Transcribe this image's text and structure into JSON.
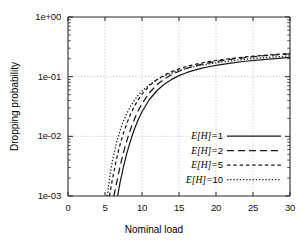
{
  "chart_data": {
    "type": "line",
    "title": "",
    "xlabel": "Nominal load",
    "ylabel": "Dropping probability",
    "xlim": [
      0,
      30
    ],
    "ylim": [
      0.001,
      1
    ],
    "yscale": "log",
    "xscale": "linear",
    "grid": true,
    "grid_style": "dotted",
    "legend_position": "lower right",
    "xticks": [
      "0",
      "5",
      "10",
      "15",
      "20",
      "25",
      "30"
    ],
    "xtick_values": [
      0,
      5,
      10,
      15,
      20,
      25,
      30
    ],
    "yticks": [
      "1e+00",
      "1e-01",
      "1e-02",
      "1e-03"
    ],
    "ytick_values": [
      1,
      0.1,
      0.01,
      0.001
    ],
    "y_minor_ticks": true,
    "series": [
      {
        "name": "E[H]=1",
        "style": "solid",
        "x": [
          6.7,
          7.0,
          7.5,
          8.0,
          8.5,
          9.0,
          9.5,
          10.0,
          11.0,
          12.0,
          13.0,
          14.0,
          15.0,
          16.0,
          17.0,
          18.0,
          19.0,
          20.0,
          22.0,
          24.0,
          26.0,
          28.0,
          30.0
        ],
        "y": [
          0.001,
          0.0016,
          0.0031,
          0.0055,
          0.0089,
          0.0135,
          0.0192,
          0.0258,
          0.0414,
          0.0581,
          0.0746,
          0.09,
          0.104,
          0.1165,
          0.1277,
          0.1377,
          0.1467,
          0.1549,
          0.1692,
          0.1813,
          0.1919,
          0.2013,
          0.2098
        ]
      },
      {
        "name": "E[H]=2",
        "style": "dashed",
        "x": [
          6.2,
          6.5,
          7.0,
          7.5,
          8.0,
          8.5,
          9.0,
          9.5,
          10.0,
          11.0,
          12.0,
          13.0,
          14.0,
          15.0,
          16.0,
          17.0,
          18.0,
          19.0,
          20.0,
          22.0,
          24.0,
          26.0,
          28.0,
          30.0
        ],
        "y": [
          0.001,
          0.0015,
          0.003,
          0.0054,
          0.0089,
          0.0137,
          0.0198,
          0.0271,
          0.0353,
          0.0537,
          0.0728,
          0.0911,
          0.108,
          0.1233,
          0.137,
          0.1493,
          0.1604,
          0.1704,
          0.1795,
          0.1956,
          0.2094,
          0.2215,
          0.2323,
          0.242
        ]
      },
      {
        "name": "E[H]=5",
        "style": "dotted-medium",
        "x": [
          5.6,
          6.0,
          6.5,
          7.0,
          7.5,
          8.0,
          8.5,
          9.0,
          9.5,
          10.0,
          11.0,
          12.0,
          13.0,
          14.0,
          15.0,
          16.0,
          17.0,
          18.0,
          19.0,
          20.0,
          22.0,
          24.0,
          26.0,
          28.0,
          30.0
        ],
        "y": [
          0.001,
          0.0019,
          0.0039,
          0.007,
          0.0114,
          0.0171,
          0.0242,
          0.0324,
          0.0414,
          0.0509,
          0.0703,
          0.0889,
          0.106,
          0.1214,
          0.1352,
          0.1476,
          0.1588,
          0.1689,
          0.1781,
          0.1866,
          0.2016,
          0.2146,
          0.226,
          0.2362,
          0.2455
        ]
      },
      {
        "name": "E[H]=10",
        "style": "dotted-fine",
        "x": [
          5.3,
          5.6,
          6.0,
          6.5,
          7.0,
          7.5,
          8.0,
          8.5,
          9.0,
          9.5,
          10.0,
          11.0,
          12.0,
          13.0,
          14.0,
          15.0,
          16.0,
          17.0,
          18.0,
          19.0,
          20.0,
          22.0,
          24.0,
          26.0,
          28.0,
          30.0
        ],
        "y": [
          0.001,
          0.0019,
          0.0039,
          0.0074,
          0.0122,
          0.0181,
          0.025,
          0.0327,
          0.0408,
          0.0491,
          0.0574,
          0.0736,
          0.0886,
          0.1024,
          0.1149,
          0.1263,
          0.1367,
          0.1462,
          0.1549,
          0.163,
          0.1704,
          0.1837,
          0.1953,
          0.2056,
          0.2148,
          0.2232
        ]
      }
    ]
  },
  "legend": {
    "entries": [
      {
        "label": "E[H]=1",
        "symbol": "E[H]=",
        "value": "1",
        "style": "solid"
      },
      {
        "label": "E[H]=2",
        "symbol": "E[H]=",
        "value": "2",
        "style": "dashed"
      },
      {
        "label": "E[H]=5",
        "symbol": "E[H]=",
        "value": "5",
        "style": "dotted-medium"
      },
      {
        "label": "E[H]=10",
        "symbol": "E[H]=",
        "value": "10",
        "style": "dotted-fine"
      }
    ]
  },
  "colors": {
    "axis": "#2b2b2b",
    "grid": "#b8b8b8",
    "curve": "#1a1a1a",
    "background": "#ffffff"
  }
}
